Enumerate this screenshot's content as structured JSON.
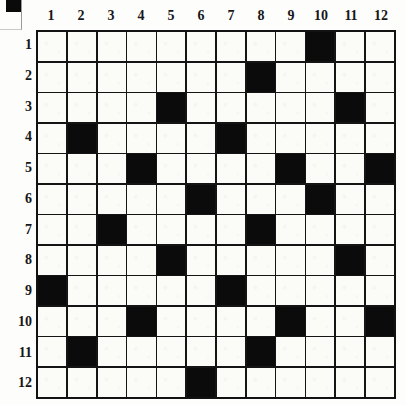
{
  "puzzle": {
    "title": "12 by 12 black and white grid puzzle",
    "rows": 12,
    "cols": 12,
    "column_headers": [
      "1",
      "2",
      "3",
      "4",
      "5",
      "6",
      "7",
      "8",
      "9",
      "10",
      "11",
      "12"
    ],
    "row_headers": [
      "1",
      "2",
      "3",
      "4",
      "5",
      "6",
      "7",
      "8",
      "9",
      "10",
      "11",
      "12"
    ],
    "colors": {
      "filled": "#0b0b0b",
      "empty": "#fbfbf8",
      "grid_line": "#141414",
      "label_text": "#17161a",
      "page_background": "#fdfdfb"
    },
    "filled_cells_by_row": [
      [
        10
      ],
      [
        8
      ],
      [
        5,
        11
      ],
      [
        2,
        7
      ],
      [
        4,
        9,
        12
      ],
      [
        6,
        10
      ],
      [
        3,
        8
      ],
      [
        5,
        11
      ],
      [
        1,
        7
      ],
      [
        4,
        9,
        12
      ],
      [
        2,
        8
      ],
      [
        6
      ]
    ],
    "filled_count": 24
  },
  "corner_mark": {
    "label": "registration mark",
    "color": "#0a0a0a"
  }
}
